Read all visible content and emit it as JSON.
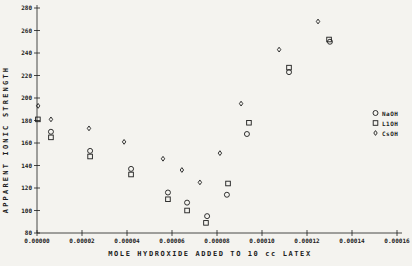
{
  "figure": {
    "background": "#f4f3ef",
    "ink_color": "#1c1c1c"
  },
  "chart_data": {
    "type": "scatter",
    "title": "",
    "xlabel": "MOLE HYDROXIDE ADDED TO 10 cc LATEX",
    "ylabel": "APPARENT IONIC STRENGTH",
    "xlim": [
      0,
      0.000162
    ],
    "ylim": [
      80,
      280
    ],
    "grid": false,
    "x_tick_values": [
      0,
      2e-05,
      4e-05,
      6e-05,
      8e-05,
      0.0001,
      0.00012,
      0.00014,
      0.00016
    ],
    "x_tick_labels": [
      "0.00000",
      "0.00002",
      "0.00004",
      "0.00006",
      "0.00008",
      "0.00010",
      "0.00012",
      "0.00014",
      "0.00016"
    ],
    "y_tick_values": [
      80,
      100,
      120,
      140,
      160,
      180,
      200,
      220,
      240,
      260,
      280
    ],
    "y_tick_labels": [
      "80",
      "100",
      "120",
      "140",
      "160",
      "180",
      "200",
      "220",
      "240",
      "260",
      "280"
    ],
    "legend": {
      "position": "right-middle",
      "entries": [
        {
          "label": "NaOH",
          "marker": "circle"
        },
        {
          "label": "L1OH",
          "marker": "square"
        },
        {
          "label": "CsOH",
          "marker": "diamond"
        }
      ]
    },
    "series": [
      {
        "name": "NaOH",
        "marker": "circle",
        "points": [
          [
            6.2e-06,
            170
          ],
          [
            2.36e-05,
            153
          ],
          [
            4.18e-05,
            137
          ],
          [
            5.82e-05,
            116
          ],
          [
            6.67e-05,
            107
          ],
          [
            7.56e-05,
            95
          ],
          [
            8.44e-05,
            114
          ],
          [
            9.33e-05,
            168
          ],
          [
            0.000112,
            223
          ],
          [
            0.0001302,
            250
          ]
        ]
      },
      {
        "name": "L1OH",
        "marker": "square",
        "points": [
          [
            4e-07,
            181
          ],
          [
            6.2e-06,
            165
          ],
          [
            2.36e-05,
            148
          ],
          [
            4.18e-05,
            132
          ],
          [
            5.82e-05,
            110
          ],
          [
            6.67e-05,
            100
          ],
          [
            7.51e-05,
            89
          ],
          [
            8.49e-05,
            124
          ],
          [
            9.42e-05,
            178
          ],
          [
            0.000112,
            227
          ],
          [
            0.0001298,
            252
          ]
        ]
      },
      {
        "name": "CsOH",
        "marker": "diamond",
        "points": [
          [
            5e-07,
            193
          ],
          [
            6.2e-06,
            181
          ],
          [
            2.31e-05,
            173
          ],
          [
            3.87e-05,
            161
          ],
          [
            5.6e-05,
            146
          ],
          [
            6.44e-05,
            136
          ],
          [
            7.24e-05,
            125
          ],
          [
            8.13e-05,
            151
          ],
          [
            9.07e-05,
            195
          ],
          [
            0.0001076,
            243
          ],
          [
            0.0001249,
            268
          ]
        ]
      }
    ]
  }
}
